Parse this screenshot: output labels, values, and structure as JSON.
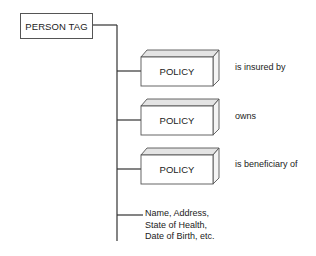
{
  "diagram": {
    "root": {
      "label": "PERSON TAG"
    },
    "branches": [
      {
        "node": "POLICY",
        "relationship": "is insured by"
      },
      {
        "node": "POLICY",
        "relationship": "owns"
      },
      {
        "node": "POLICY",
        "relationship": "is beneficiary of"
      }
    ],
    "attributes": {
      "line1": "Name, Address,",
      "line2": "State of Health,",
      "line3": "Date of Birth, etc."
    },
    "colors": {
      "line": "#333333",
      "box_border": "#555555",
      "bevel_fill": "#e4e4e4"
    }
  }
}
